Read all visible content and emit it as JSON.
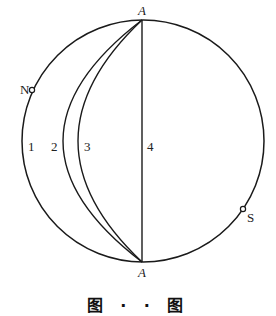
{
  "diagram": {
    "type": "stereographic-projection",
    "colors": {
      "stroke": "#1a1a1a",
      "background": "#ffffff"
    },
    "primitive_circle": {
      "cx": 143,
      "cy": 141,
      "r": 121
    },
    "points": {
      "top_A": {
        "label": "A",
        "x": 142,
        "y": 20
      },
      "bottom_A": {
        "label": "A",
        "x": 142,
        "y": 262
      },
      "N": {
        "label": "N",
        "x": 32,
        "y": 90
      },
      "S": {
        "label": "S",
        "x": 243,
        "y": 209
      }
    },
    "great_circles": [
      {
        "id": "1",
        "label": "1"
      },
      {
        "id": "2",
        "label": "2"
      },
      {
        "id": "3",
        "label": "3"
      },
      {
        "id": "4",
        "label": "4"
      }
    ],
    "caption": "图 · · 图"
  }
}
